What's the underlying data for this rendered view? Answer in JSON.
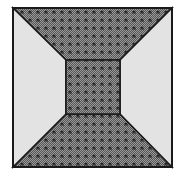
{
  "figure": {
    "outer_square": {
      "x": 13,
      "y": 8,
      "size": 159
    },
    "inner_square": {
      "x": 66,
      "y": 60,
      "size": 54
    },
    "colors": {
      "background": "#ffffff",
      "light_face": "#e3e3e3",
      "pattern_dark": "#555555",
      "pattern_light": "#9a9a9a",
      "glyph": "#1e1e1e",
      "stroke": "#1a1a1a"
    },
    "faces": [
      {
        "name": "top-face",
        "fill": "patterned"
      },
      {
        "name": "bottom-face",
        "fill": "patterned"
      },
      {
        "name": "left-face",
        "fill": "light"
      },
      {
        "name": "right-face",
        "fill": "light"
      },
      {
        "name": "center-square",
        "fill": "patterned"
      }
    ],
    "pattern_spacing": 8
  }
}
